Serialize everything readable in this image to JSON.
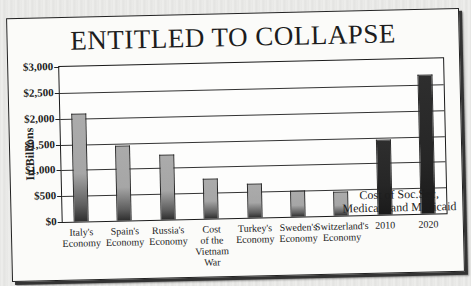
{
  "chart_data": {
    "type": "bar",
    "title": "ENTITLED TO COLLAPSE",
    "xlabel": "",
    "ylabel": "In Billions",
    "ylim": [
      0,
      3000
    ],
    "yticks": [
      "$3,000",
      "$2,500",
      "$2,000",
      "$1,500",
      "$1,000",
      "$500",
      "$0"
    ],
    "grid": true,
    "legend": null,
    "categories": [
      "Italy's Economy",
      "Spain's Economy",
      "Russia's Economy",
      "Cost of the Vietnam War",
      "Turkey's Economy",
      "Sweden's Economy",
      "Switzerland's Economy",
      "2010",
      "2020"
    ],
    "values": [
      2100,
      1460,
      1260,
      770,
      650,
      500,
      460,
      1450,
      2700
    ],
    "group_annotation": "Cost of Soc.Sec, Medicare and Medicaid",
    "group_annotation_applies_to": [
      "2010",
      "2020"
    ]
  },
  "title": "ENTITLED TO COLLAPSE",
  "y_axis_label": "In Billions",
  "y_ticks": [
    {
      "label": "$3,000",
      "value": 3000
    },
    {
      "label": "$2,500",
      "value": 2500
    },
    {
      "label": "$2,000",
      "value": 2000
    },
    {
      "label": "$1,500",
      "value": 1500
    },
    {
      "label": "$1,000",
      "value": 1000
    },
    {
      "label": "$500",
      "value": 500
    },
    {
      "label": "$0",
      "value": 0
    }
  ],
  "bars": [
    {
      "label_lines": [
        "Italy's",
        "Economy"
      ],
      "value": 2100,
      "style": "light"
    },
    {
      "label_lines": [
        "Spain's",
        "Economy"
      ],
      "value": 1460,
      "style": "light"
    },
    {
      "label_lines": [
        "Russia's",
        "Economy"
      ],
      "value": 1260,
      "style": "light"
    },
    {
      "label_lines": [
        "Cost",
        "of the",
        "Vietnam",
        "War"
      ],
      "value": 770,
      "style": "light"
    },
    {
      "label_lines": [
        "Turkey's",
        "Economy"
      ],
      "value": 650,
      "style": "light"
    },
    {
      "label_lines": [
        "Sweden's",
        "Economy"
      ],
      "value": 500,
      "style": "light"
    },
    {
      "label_lines": [
        "Switzerland's",
        "Economy"
      ],
      "value": 460,
      "style": "light"
    },
    {
      "label_lines": [
        "2010"
      ],
      "value": 1450,
      "style": "dark"
    },
    {
      "label_lines": [
        "2020"
      ],
      "value": 2700,
      "style": "dark"
    }
  ],
  "group_label_lines": [
    "Cost of Soc.Sec,",
    "Medicare and Medicaid"
  ],
  "colors": {
    "light_bar_top": "#ababab",
    "light_bar_bottom": "#2e2e2e",
    "dark_bar": "#262626",
    "card_bg": "#fbfbf9",
    "frame": "#1a1a1a"
  }
}
